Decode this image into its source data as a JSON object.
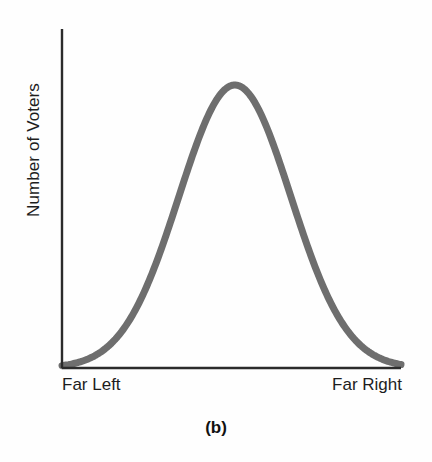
{
  "figure": {
    "caption": "(b)",
    "axis_color": "#2b2b2b",
    "curve_color": "#6e6e6e",
    "background": "#fefefe"
  },
  "chart_data": {
    "type": "line",
    "title": "",
    "subtitle": "",
    "xlabel": "",
    "ylabel": "Number of Voters",
    "annotations": [
      "(b)"
    ],
    "legend": [],
    "legend_position": "none",
    "grid": false,
    "axis_ticks": false,
    "xlim": [
      0,
      1
    ],
    "ylim": [
      0,
      1
    ],
    "xtick_labels": [
      "Far Left",
      "Far Right"
    ],
    "ytick_labels": [],
    "distribution": {
      "shape": "normal",
      "mean": 0.51,
      "std_dev": 0.165,
      "peak_height": 1.0,
      "modality": "unimodal",
      "symmetry": "symmetric"
    },
    "series": [
      {
        "name": "Voter distribution",
        "x": [
          0.0,
          0.05,
          0.1,
          0.15,
          0.2,
          0.25,
          0.3,
          0.35,
          0.4,
          0.45,
          0.5,
          0.55,
          0.6,
          0.65,
          0.7,
          0.75,
          0.8,
          0.85,
          0.9,
          0.95,
          1.0
        ],
        "values": [
          0.01,
          0.02,
          0.04,
          0.07,
          0.13,
          0.22,
          0.34,
          0.49,
          0.66,
          0.83,
          0.98,
          1.0,
          0.92,
          0.77,
          0.6,
          0.42,
          0.27,
          0.16,
          0.08,
          0.04,
          0.02
        ]
      }
    ]
  },
  "labels": {
    "y_axis_title": "Number of Voters",
    "x_left": "Far Left",
    "x_right": "Far Right"
  }
}
